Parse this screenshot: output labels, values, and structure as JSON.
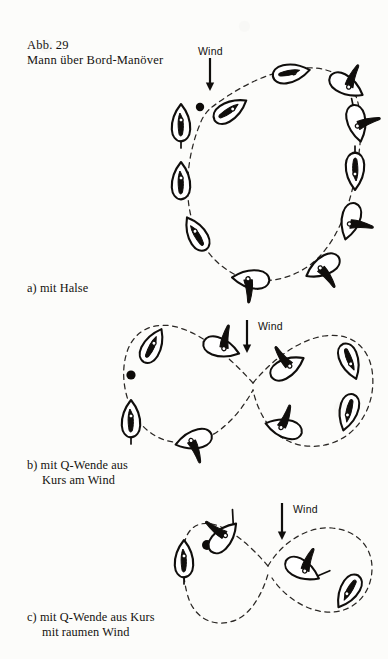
{
  "figure": {
    "number_label": "Abb. 29",
    "title": "Mann über Bord-Manöver",
    "page_background": "#fcfcfa",
    "ink_color": "#100e0c"
  },
  "wind_labels": {
    "a": "Wind",
    "b": "Wind",
    "c": "Wind"
  },
  "captions": {
    "a": "a) mit Halse",
    "b_line1": "b) mit Q-Wende aus",
    "b_line2": "Kurs am Wind",
    "c_line1": "c) mit Q-Wende aus Kurs",
    "c_line2": "mit raumen Wind"
  },
  "diagrams": [
    {
      "id": "a",
      "name": "man-overboard-gybe",
      "caption": "a) mit Halse",
      "wind_direction": "down",
      "track_shape": "oval-loop",
      "boat_count": 11,
      "man_overboard_marker": true
    },
    {
      "id": "b",
      "name": "man-overboard-quick-turn-close-hauled",
      "caption": "b) mit Q-Wende aus Kurs am Wind",
      "wind_direction": "down",
      "track_shape": "figure-eight",
      "boat_count": 8,
      "man_overboard_marker": true
    },
    {
      "id": "c",
      "name": "man-overboard-quick-turn-broad-reach",
      "caption": "c) mit Q-Wende aus Kurs mit raumen Wind",
      "wind_direction": "down",
      "track_shape": "figure-eight",
      "boat_count": 4,
      "man_overboard_marker": true
    }
  ]
}
